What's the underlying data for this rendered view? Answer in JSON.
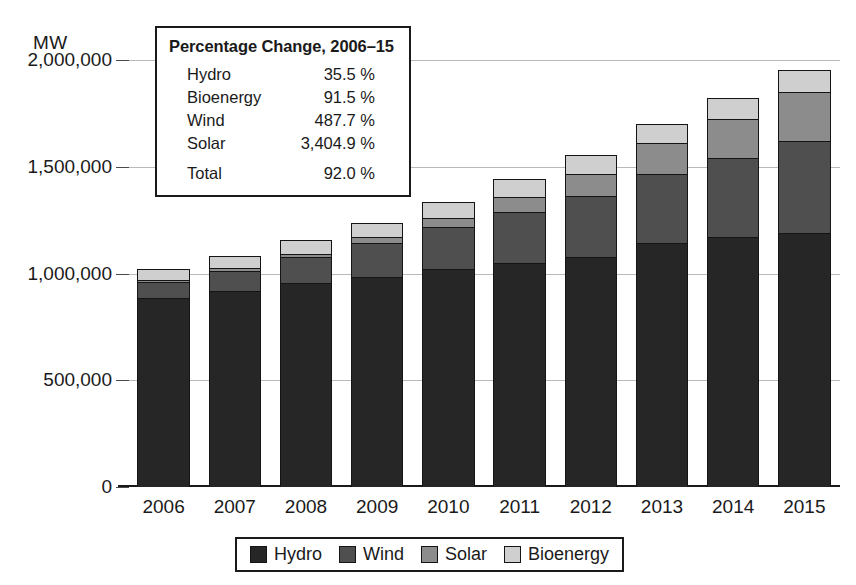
{
  "chart_data": {
    "type": "bar",
    "stacked": true,
    "title": "",
    "xlabel": "",
    "ylabel": "MW",
    "ylim": [
      0,
      2000000
    ],
    "yticks": [
      0,
      500000,
      1000000,
      1500000,
      2000000
    ],
    "ytick_labels": [
      "0",
      "500,000",
      "1,000,000",
      "1,500,000",
      "2,000,000"
    ],
    "grid": true,
    "legend_position": "bottom",
    "categories": [
      "2006",
      "2007",
      "2008",
      "2009",
      "2010",
      "2011",
      "2012",
      "2013",
      "2014",
      "2015"
    ],
    "series": [
      {
        "name": "Hydro",
        "color": "#262626",
        "values": [
          887000,
          920000,
          955000,
          985000,
          1020000,
          1048000,
          1078000,
          1145000,
          1170000,
          1188000
        ]
      },
      {
        "name": "Wind",
        "color": "#4f4f4f",
        "values": [
          74000,
          94000,
          121000,
          159000,
          198000,
          238000,
          283000,
          319000,
          371000,
          434000
        ]
      },
      {
        "name": "Solar",
        "color": "#8c8c8c",
        "values": [
          7000,
          10000,
          17000,
          25000,
          43000,
          74000,
          106000,
          145000,
          183000,
          229000
        ]
      },
      {
        "name": "Bioenergy",
        "color": "#cfcfcf",
        "values": [
          53000,
          58000,
          63000,
          68000,
          75000,
          82000,
          87000,
          92000,
          97000,
          102000
        ]
      }
    ]
  },
  "axis": {
    "unit_label": "MW"
  },
  "inset": {
    "title": "Percentage Change, 2006–15",
    "rows": [
      {
        "label": "Hydro",
        "value": "35.5 %"
      },
      {
        "label": "Bioenergy",
        "value": "91.5 %"
      },
      {
        "label": "Wind",
        "value": "487.7 %"
      },
      {
        "label": "Solar",
        "value": "3,404.9 %"
      }
    ],
    "total": {
      "label": "Total",
      "value": "92.0 %"
    }
  },
  "legend": {
    "items": [
      {
        "label": "Hydro",
        "color": "#262626"
      },
      {
        "label": "Wind",
        "color": "#4f4f4f"
      },
      {
        "label": "Solar",
        "color": "#8c8c8c"
      },
      {
        "label": "Bioenergy",
        "color": "#cfcfcf"
      }
    ]
  }
}
